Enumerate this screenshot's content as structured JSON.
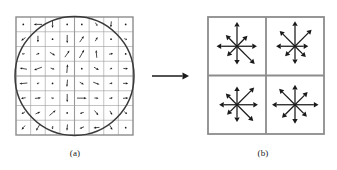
{
  "figure": {
    "width": 337,
    "height": 170,
    "background_color": "#ffffff",
    "panels": [
      {
        "id": "a",
        "caption": "(a)",
        "role": "image-gradients",
        "description": "8 by 8 array of image gradient samples with a circular Gaussian weighting window overlaid",
        "grid": {
          "rows": 8,
          "cols": 8,
          "x": 16,
          "y": 17,
          "width": 117,
          "height": 118
        },
        "quadrant_divider": true,
        "circle": {
          "cx": 74.5,
          "cy": 76,
          "r": 59.5
        }
      },
      {
        "id": "b",
        "caption": "(b)",
        "role": "keypoint-descriptor",
        "description": "2 by 2 array of orientation histograms, each summarising 8 directions",
        "grid": {
          "rows": 2,
          "cols": 2,
          "x": 208,
          "y": 17,
          "width": 116,
          "height": 117
        }
      }
    ],
    "transition_arrow": {
      "name": "right-arrow",
      "x1": 152,
      "y1": 76,
      "x2": 189,
      "y2": 76,
      "color": "#1a1a1a"
    },
    "colors": {
      "ink": "#1a1a1a",
      "grid_line": "#9a9a9a",
      "frame_line": "#8c8c8c",
      "circle": "#3a3a3a",
      "background": "#ffffff"
    }
  },
  "chart_data": {
    "type": "scatter",
    "xlabel": "",
    "ylabel": "",
    "panel_a": {
      "type": "quiver",
      "description": "Image gradients: magnitude and orientation sampled on an 8x8 grid, weighted by a Gaussian window (circle)",
      "grid_rows": 8,
      "grid_cols": 8,
      "gaussian_window_radius_cells": 4,
      "vectors": [
        [
          {
            "angle": 250,
            "mag": 0.12
          },
          {
            "angle": 180,
            "mag": 0.62
          },
          {
            "angle": 270,
            "mag": 0.55
          },
          {
            "angle": 200,
            "mag": 0.1
          },
          {
            "angle": 95,
            "mag": 0.18
          },
          {
            "angle": 300,
            "mag": 0.3
          },
          {
            "angle": 265,
            "mag": 0.45
          },
          {
            "angle": 185,
            "mag": 0.12
          }
        ],
        [
          {
            "angle": 215,
            "mag": 0.4
          },
          {
            "angle": 270,
            "mag": 0.5
          },
          {
            "angle": 175,
            "mag": 0.12
          },
          {
            "angle": 270,
            "mag": 0.62
          },
          {
            "angle": 55,
            "mag": 0.55
          },
          {
            "angle": 60,
            "mag": 0.35
          },
          {
            "angle": 140,
            "mag": 0.15
          },
          {
            "angle": 340,
            "mag": 0.22
          }
        ],
        [
          {
            "angle": 190,
            "mag": 0.2
          },
          {
            "angle": 20,
            "mag": 0.25
          },
          {
            "angle": 330,
            "mag": 0.45
          },
          {
            "angle": 55,
            "mag": 0.6
          },
          {
            "angle": 60,
            "mag": 0.7
          },
          {
            "angle": 95,
            "mag": 0.58
          },
          {
            "angle": 10,
            "mag": 0.3
          },
          {
            "angle": 345,
            "mag": 0.18
          }
        ],
        [
          {
            "angle": 170,
            "mag": 0.55
          },
          {
            "angle": 200,
            "mag": 0.62
          },
          {
            "angle": 345,
            "mag": 0.3
          },
          {
            "angle": 85,
            "mag": 0.65
          },
          {
            "angle": 25,
            "mag": 0.18
          },
          {
            "angle": 330,
            "mag": 0.42
          },
          {
            "angle": 20,
            "mag": 0.2
          },
          {
            "angle": 355,
            "mag": 0.35
          }
        ],
        [
          {
            "angle": 185,
            "mag": 0.6
          },
          {
            "angle": 200,
            "mag": 0.2
          },
          {
            "angle": 10,
            "mag": 0.12
          },
          {
            "angle": 265,
            "mag": 0.55
          },
          {
            "angle": 330,
            "mag": 0.35
          },
          {
            "angle": 340,
            "mag": 0.5
          },
          {
            "angle": 10,
            "mag": 0.22
          },
          {
            "angle": 0,
            "mag": 0.38
          }
        ],
        [
          {
            "angle": 190,
            "mag": 0.35
          },
          {
            "angle": 5,
            "mag": 0.45
          },
          {
            "angle": 350,
            "mag": 0.2
          },
          {
            "angle": 270,
            "mag": 0.62
          },
          {
            "angle": 0,
            "mag": 0.72
          },
          {
            "angle": 355,
            "mag": 0.3
          },
          {
            "angle": 10,
            "mag": 0.25
          },
          {
            "angle": 5,
            "mag": 0.4
          }
        ],
        [
          {
            "angle": 210,
            "mag": 0.3
          },
          {
            "angle": 25,
            "mag": 0.4
          },
          {
            "angle": 40,
            "mag": 0.6
          },
          {
            "angle": 95,
            "mag": 0.12
          },
          {
            "angle": 195,
            "mag": 0.3
          },
          {
            "angle": 310,
            "mag": 0.45
          },
          {
            "angle": 300,
            "mag": 0.35
          },
          {
            "angle": 320,
            "mag": 0.28
          }
        ],
        [
          {
            "angle": 230,
            "mag": 0.4
          },
          {
            "angle": 240,
            "mag": 0.55
          },
          {
            "angle": 260,
            "mag": 0.25
          },
          {
            "angle": 265,
            "mag": 0.48
          },
          {
            "angle": 200,
            "mag": 0.35
          },
          {
            "angle": 185,
            "mag": 0.45
          },
          {
            "angle": 300,
            "mag": 0.4
          },
          {
            "angle": 340,
            "mag": 0.18
          }
        ]
      ]
    },
    "panel_b": {
      "type": "orientation-histograms",
      "description": "2x2 array of 8-bin orientation histograms; bin length encodes summed gradient magnitude",
      "bin_angles_deg": [
        0,
        45,
        90,
        135,
        180,
        225,
        270,
        315
      ],
      "cells": [
        {
          "row": 0,
          "col": 0,
          "name": "histogram-top-left",
          "values": [
            0.78,
            0.58,
            0.95,
            0.62,
            0.8,
            0.55,
            0.72,
            0.98
          ]
        },
        {
          "row": 0,
          "col": 1,
          "name": "histogram-top-right",
          "values": [
            0.52,
            0.92,
            0.98,
            0.85,
            0.74,
            0.55,
            0.7,
            0.6
          ]
        },
        {
          "row": 1,
          "col": 0,
          "name": "histogram-bottom-left",
          "values": [
            0.82,
            0.95,
            0.72,
            0.62,
            0.7,
            0.55,
            0.68,
            0.9
          ]
        },
        {
          "row": 1,
          "col": 1,
          "name": "histogram-bottom-right",
          "values": [
            0.92,
            0.7,
            0.78,
            0.88,
            0.9,
            0.72,
            0.74,
            0.66
          ]
        }
      ]
    }
  }
}
